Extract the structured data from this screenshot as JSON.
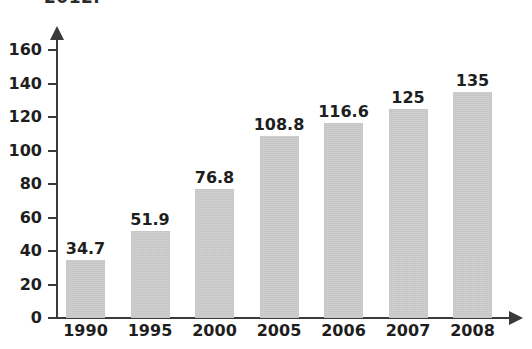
{
  "page": {
    "cropped_caption_top": "2012."
  },
  "chart_data": {
    "type": "bar",
    "title": "",
    "subtitle": "",
    "xlabel": "",
    "ylabel": "",
    "categories": [
      "1990",
      "1995",
      "2000",
      "2005",
      "2006",
      "2007",
      "2008"
    ],
    "values": [
      34.7,
      51.9,
      76.8,
      108.8,
      116.6,
      125,
      135
    ],
    "value_labels": [
      "34.7",
      "51.9",
      "76.8",
      "108.8",
      "116.6",
      "125",
      "135"
    ],
    "ylim": [
      0,
      160
    ],
    "ytick_labels": [
      "0",
      "20",
      "40",
      "60",
      "80",
      "100",
      "120",
      "140",
      "160"
    ],
    "ytick_values": [
      0,
      20,
      40,
      60,
      80,
      100,
      120,
      140,
      160
    ],
    "grid": false,
    "legend": null,
    "bar_color": "#cfcfcf",
    "axis_color": "#3a3a3a",
    "text_color": "#1e1e1e",
    "axis_style": "arrow-ended"
  }
}
